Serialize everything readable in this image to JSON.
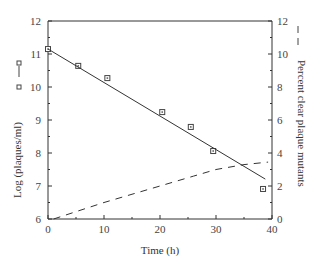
{
  "chart_data": {
    "type": "line",
    "title": "",
    "xlabel": "Time (h)",
    "ylabel": "Log (plaques/ml)",
    "y2label": "Percent clear plaque mutants",
    "xlim": [
      0,
      40
    ],
    "ylim": [
      6,
      12
    ],
    "y2lim": [
      0,
      12
    ],
    "x_ticks": [
      0,
      10,
      20,
      30,
      40
    ],
    "y_ticks": [
      6,
      7,
      8,
      9,
      10,
      11,
      12
    ],
    "y2_ticks": [
      0,
      2,
      4,
      6,
      8,
      10,
      12
    ],
    "grid": false,
    "series": [
      {
        "name": "Log (plaques/ml)",
        "axis": "left",
        "style": "square markers",
        "x": [
          0,
          5.4,
          10.6,
          20.4,
          25.5,
          29.5,
          38.4
        ],
        "values": [
          11.15,
          10.64,
          10.27,
          9.24,
          8.79,
          8.06,
          6.91
        ]
      },
      {
        "name": "Log (plaques/ml) fit",
        "axis": "left",
        "style": "solid line",
        "x": [
          0,
          38.8
        ],
        "values": [
          11.15,
          7.21
        ]
      },
      {
        "name": "Percent clear plaque mutants",
        "axis": "right",
        "style": "dashed line",
        "x": [
          1,
          10,
          20,
          26,
          30,
          35,
          39.3
        ],
        "values": [
          0,
          1.0,
          2.0,
          2.6,
          3.0,
          3.3,
          3.45
        ]
      }
    ],
    "legend": {
      "left_marker": "square-markers with solid line",
      "right_marker": "dashed line"
    }
  }
}
